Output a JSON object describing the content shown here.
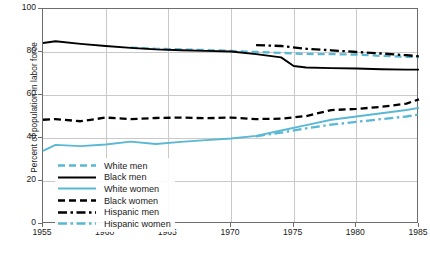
{
  "chart_data": {
    "type": "line",
    "title": "",
    "xlabel": "",
    "ylabel": "Percent of population in labor force",
    "xlim": [
      1955,
      1985
    ],
    "ylim": [
      0,
      100
    ],
    "xticks": [
      1955,
      1960,
      1965,
      1970,
      1975,
      1980,
      1985
    ],
    "yticks": [
      0,
      20,
      40,
      60,
      80,
      100
    ],
    "grid": true,
    "legend_position": "lower-left-inside",
    "series": [
      {
        "name": "White men",
        "color": "#5BB8D4",
        "style": "dashed",
        "x": [
          1962,
          1964,
          1966,
          1968,
          1970,
          1972,
          1974,
          1976,
          1978,
          1980,
          1982,
          1984,
          1985
        ],
        "values": [
          82.0,
          81.5,
          81.2,
          80.9,
          80.5,
          80.0,
          79.6,
          79.1,
          79.0,
          78.8,
          78.2,
          77.8,
          77.6
        ]
      },
      {
        "name": "Black men",
        "color": "#000000",
        "style": "solid",
        "x": [
          1955,
          1956,
          1958,
          1960,
          1962,
          1964,
          1966,
          1968,
          1970,
          1972,
          1974,
          1975,
          1976,
          1978,
          1980,
          1982,
          1984,
          1985
        ],
        "values": [
          84.2,
          85.0,
          83.8,
          82.8,
          81.9,
          81.2,
          80.8,
          80.5,
          80.2,
          79.0,
          77.5,
          73.5,
          72.8,
          72.5,
          72.3,
          72.0,
          71.8,
          71.8
        ]
      },
      {
        "name": "White women",
        "color": "#5BB8D4",
        "style": "solid",
        "x": [
          1955,
          1956,
          1958,
          1960,
          1962,
          1964,
          1966,
          1968,
          1970,
          1972,
          1974,
          1976,
          1978,
          1980,
          1982,
          1984,
          1985
        ],
        "values": [
          34.0,
          36.8,
          36.2,
          37.0,
          38.3,
          37.2,
          38.2,
          39.0,
          39.8,
          41.0,
          43.5,
          46.0,
          48.5,
          50.0,
          51.5,
          53.0,
          54.0
        ]
      },
      {
        "name": "Black women",
        "color": "#000000",
        "style": "dashed",
        "x": [
          1955,
          1956,
          1958,
          1960,
          1962,
          1964,
          1966,
          1968,
          1970,
          1972,
          1974,
          1976,
          1978,
          1980,
          1982,
          1984,
          1985
        ],
        "values": [
          48.5,
          48.8,
          47.8,
          49.5,
          48.8,
          49.3,
          49.5,
          49.2,
          49.5,
          48.8,
          49.0,
          50.2,
          53.0,
          53.5,
          54.5,
          56.0,
          58.0
        ]
      },
      {
        "name": "Hispanic men",
        "color": "#000000",
        "style": "dashdot",
        "x": [
          1972,
          1974,
          1976,
          1978,
          1980,
          1982,
          1984,
          1985
        ],
        "values": [
          83.2,
          82.8,
          81.5,
          80.8,
          80.0,
          79.3,
          78.5,
          78.0
        ]
      },
      {
        "name": "Hispanic women",
        "color": "#5BB8D4",
        "style": "dashdot",
        "x": [
          1972,
          1974,
          1976,
          1978,
          1980,
          1982,
          1984,
          1985
        ],
        "values": [
          40.8,
          42.5,
          44.5,
          46.2,
          47.5,
          48.8,
          50.0,
          51.0
        ]
      }
    ]
  },
  "axes": {
    "ylabel": "Percent of population in labor force",
    "yticks": [
      "0",
      "20",
      "40",
      "60",
      "80",
      "100"
    ],
    "xticks": [
      "1955",
      "1960",
      "1965",
      "1970",
      "1975",
      "1980",
      "1985"
    ]
  },
  "legend": {
    "items": [
      {
        "label": "White men"
      },
      {
        "label": "Black men"
      },
      {
        "label": "White women"
      },
      {
        "label": "Black women"
      },
      {
        "label": "Hispanic men"
      },
      {
        "label": "Hispanic women"
      }
    ]
  },
  "colors": {
    "blue": "#5BB8D4",
    "black": "#000000",
    "grid": "#c9c9c9",
    "frame": "#6d6d6d"
  }
}
